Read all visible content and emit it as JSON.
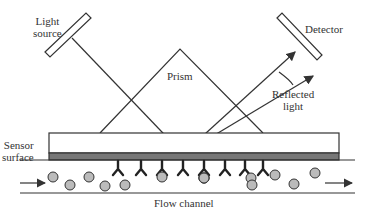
{
  "diagram": {
    "labels": {
      "light_source_line1": "Light",
      "light_source_line2": "source",
      "detector": "Detector",
      "prism": "Prism",
      "reflected_light_line1": "Reflected",
      "reflected_light_line2": "light",
      "sensor_surface_line1": "Sensor",
      "sensor_surface_line2": "surface",
      "flow_channel": "Flow channel"
    },
    "colors": {
      "line": "#333333",
      "sensor_layer": "#777777",
      "particle_fill": "#bbbbbb"
    },
    "antibody_count": 8,
    "particle_count": 13
  }
}
